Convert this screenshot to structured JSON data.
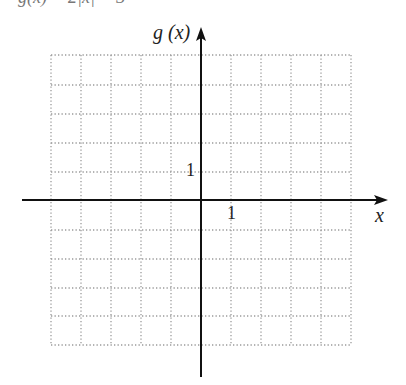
{
  "header": {
    "cut_text": "g(x) = 2|x| − 3"
  },
  "graph": {
    "y_axis_label": "g (x)",
    "x_axis_label": "x",
    "x_tick_label": "1",
    "y_tick_label": "1",
    "grid": {
      "x_min": -5,
      "x_max": 5,
      "y_min": -5,
      "y_max": 5,
      "unit": 1,
      "style": "dotted"
    },
    "colors": {
      "axis": "#111111",
      "grid": "#9a9a9a"
    }
  }
}
